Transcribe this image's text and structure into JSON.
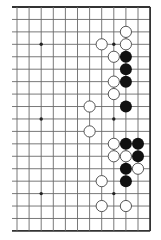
{
  "diagram": {
    "type": "go-board-fragment",
    "board_size": 19,
    "visible_columns": 12,
    "visible_rows": 19,
    "edges_shown": [
      "top",
      "right",
      "bottom"
    ],
    "open_edge": "left",
    "first_visible_board_column": 8,
    "star_points": [
      {
        "c": 2,
        "r": 3
      },
      {
        "c": 8,
        "r": 3
      },
      {
        "c": 2,
        "r": 9
      },
      {
        "c": 8,
        "r": 9
      },
      {
        "c": 2,
        "r": 15
      },
      {
        "c": 8,
        "r": 15
      }
    ],
    "stones": {
      "white": [
        {
          "c": 9,
          "r": 2
        },
        {
          "c": 7,
          "r": 3
        },
        {
          "c": 9,
          "r": 3
        },
        {
          "c": 8,
          "r": 4
        },
        {
          "c": 8,
          "r": 6
        },
        {
          "c": 8,
          "r": 7
        },
        {
          "c": 6,
          "r": 8
        },
        {
          "c": 6,
          "r": 10
        },
        {
          "c": 8,
          "r": 11
        },
        {
          "c": 8,
          "r": 12
        },
        {
          "c": 9,
          "r": 12
        },
        {
          "c": 10,
          "r": 13
        },
        {
          "c": 7,
          "r": 14
        },
        {
          "c": 7,
          "r": 16
        },
        {
          "c": 9,
          "r": 16
        }
      ],
      "black": [
        {
          "c": 9,
          "r": 4
        },
        {
          "c": 9,
          "r": 5
        },
        {
          "c": 9,
          "r": 6
        },
        {
          "c": 9,
          "r": 8
        },
        {
          "c": 9,
          "r": 11
        },
        {
          "c": 10,
          "r": 11
        },
        {
          "c": 10,
          "r": 12
        },
        {
          "c": 9,
          "r": 13
        },
        {
          "c": 9,
          "r": 14
        }
      ]
    },
    "colors": {
      "background": "#ffffff",
      "grid_line": "#6a6a6a",
      "edge_line": "#333333",
      "black_stone": "#111111",
      "white_stone_fill": "#ffffff",
      "white_stone_outline": "#444444",
      "star_point": "#222222"
    }
  }
}
